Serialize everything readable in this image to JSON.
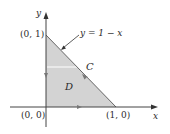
{
  "diagram": {
    "type": "region-with-boundary",
    "colors": {
      "region_fill": "#d3d3d3",
      "axis": "#444444",
      "boundary": "#555555",
      "background": "#ffffff"
    },
    "axes": {
      "x_label": "x",
      "y_label": "y"
    },
    "vertices": [
      {
        "label": "(0, 1)"
      },
      {
        "label": "(0, 0)"
      },
      {
        "label": "(1, 0)"
      }
    ],
    "curve_label": "y = 1 − x",
    "boundary_label": "C",
    "region_label": "D"
  }
}
